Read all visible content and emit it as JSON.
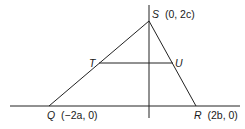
{
  "diagram": {
    "type": "geometry-triangle",
    "points": {
      "S": {
        "label": "S",
        "coords_label": "(0,  2c)",
        "x": 149,
        "y": 21
      },
      "Q": {
        "label": "Q",
        "coords_label": "(−2a,  0)",
        "x": 49,
        "y": 106
      },
      "R": {
        "label": "R",
        "coords_label": "(2b,  0)",
        "x": 196,
        "y": 106
      },
      "T": {
        "label": "T",
        "x": 99,
        "y": 63
      },
      "U": {
        "label": "U",
        "x": 172,
        "y": 63
      }
    },
    "segments": [
      "QS",
      "SR",
      "TU"
    ],
    "axes": {
      "x_axis": true,
      "y_axis": true
    },
    "colors": {
      "line": "#222222",
      "text": "#1a1a1a",
      "background": "#ffffff"
    }
  }
}
